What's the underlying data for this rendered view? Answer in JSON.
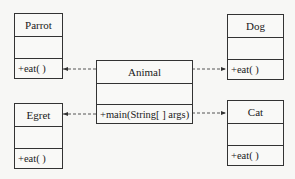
{
  "diagram": {
    "type": "uml-class",
    "classes": [
      {
        "name": "Parrot",
        "operations": [
          "+eat( )"
        ]
      },
      {
        "name": "Dog",
        "operations": [
          "+eat( )"
        ]
      },
      {
        "name": "Animal",
        "operations": [
          "+main(String[ ] args)"
        ]
      },
      {
        "name": "Egret",
        "operations": [
          "+eat( )"
        ]
      },
      {
        "name": "Cat",
        "operations": [
          "+eat( )"
        ]
      }
    ],
    "relations": [
      {
        "from": "Animal",
        "to": "Parrot",
        "style": "dashed-arrow"
      },
      {
        "from": "Animal",
        "to": "Dog",
        "style": "dashed-arrow"
      },
      {
        "from": "Animal",
        "to": "Egret",
        "style": "dashed-arrow"
      },
      {
        "from": "Animal",
        "to": "Cat",
        "style": "dashed-arrow"
      }
    ],
    "colors": {
      "line": "#333333",
      "background": "#f7f7f5"
    }
  }
}
